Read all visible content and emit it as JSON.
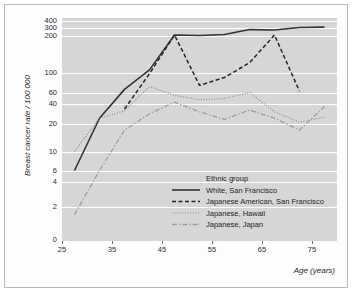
{
  "chart_data": {
    "type": "line",
    "title": "",
    "xlabel": "Age (years)",
    "ylabel": "Breast cancer rate / 100 000",
    "yscale": "log",
    "ylim": [
      1.3,
      470
    ],
    "xlim": [
      25,
      80
    ],
    "grid": true,
    "legend_position": "inside-bottom-right",
    "legend_title": "Ethnic group",
    "xticks": [
      25,
      35,
      45,
      55,
      65,
      75
    ],
    "xtick_labels": [
      "25",
      "35",
      "45",
      "55",
      "65",
      "75"
    ],
    "yticks": [
      0,
      2,
      4,
      6,
      10,
      20,
      40,
      60,
      100,
      200,
      300,
      400
    ],
    "ytick_labels": [
      "0",
      "2",
      "4",
      "6",
      "10",
      "20",
      "40",
      "60",
      "100",
      "200",
      "300",
      "400"
    ],
    "series": [
      {
        "name": "White, San Francisco",
        "style": "solid",
        "color": "#333333",
        "x": [
          27.5,
          32.5,
          37.5,
          42.5,
          47.5,
          52.5,
          57.5,
          62.5,
          67.5,
          72.5,
          77.5
        ],
        "values": [
          6,
          24,
          65,
          105,
          205,
          200,
          210,
          270,
          265,
          300,
          305
        ]
      },
      {
        "name": "Japanese American, San Francisco",
        "style": "dashed",
        "color": "#242424",
        "x": [
          37.5,
          42.5,
          47.5,
          52.5,
          57.5,
          62.5,
          67.5,
          72.5
        ],
        "values": [
          33,
          97,
          205,
          72,
          88,
          120,
          205,
          62
        ]
      },
      {
        "name": "Japanese, Hawaii",
        "style": "dotted",
        "color": "#8c8c8c",
        "x": [
          27.5,
          32.5,
          37.5,
          42.5,
          47.5,
          52.5,
          57.5,
          62.5,
          67.5,
          72.5,
          77.5
        ],
        "values": [
          10,
          24,
          31,
          70,
          54,
          46,
          48,
          60,
          30,
          21,
          25
        ]
      },
      {
        "name": "Japanese, Japan",
        "style": "dashdot",
        "color": "#9a9a9a",
        "x": [
          27.5,
          32.5,
          37.5,
          42.5,
          47.5,
          52.5,
          57.5,
          62.5,
          67.5,
          72.5,
          77.5
        ],
        "values": [
          1.6,
          6,
          17,
          28,
          42,
          30,
          23,
          32,
          24,
          17,
          36
        ]
      }
    ]
  },
  "axes": {
    "y_label": "Breast cancer rate / 100 000",
    "x_label": "Age (years)"
  },
  "legend": {
    "title": "Ethnic group",
    "items": [
      {
        "label": "White, San Francisco",
        "style": "solid"
      },
      {
        "label": "Japanese American, San Francisco",
        "style": "dashed"
      },
      {
        "label": "Japanese, Hawaii",
        "style": "dotted"
      },
      {
        "label": "Japanese, Japan",
        "style": "dashdot"
      }
    ]
  },
  "colors": {
    "plot_background": "#d6d6d6",
    "gridline": "#ffffff",
    "frame_border": "#b9b9b9",
    "page_background": "#ffffff",
    "solid_series": "#333333",
    "dashed_series": "#242424",
    "dotted_series": "#8c8c8c",
    "dashdot_series": "#9a9a9a"
  }
}
